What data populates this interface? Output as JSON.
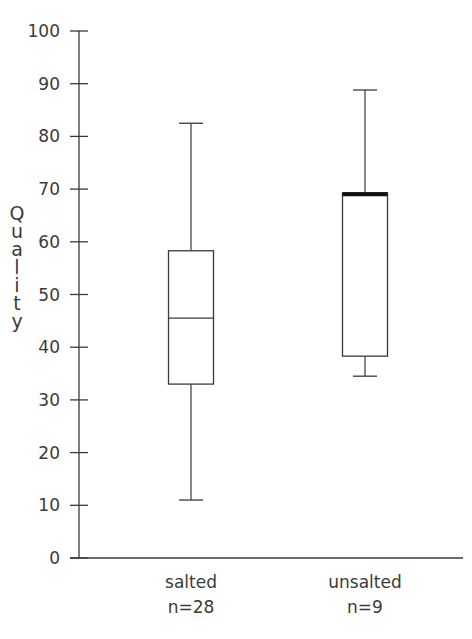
{
  "chart_data": {
    "type": "boxplot",
    "title": "",
    "xlabel": "",
    "ylabel": "Quality",
    "ylim": [
      0,
      100
    ],
    "yticks": [
      0,
      10,
      20,
      30,
      40,
      50,
      60,
      70,
      80,
      90,
      100
    ],
    "grid": false,
    "legend": null,
    "categories": [
      "salted",
      "unsalted"
    ],
    "category_counts": [
      "n=28",
      "n=9"
    ],
    "series": [
      {
        "name": "salted",
        "n": 28,
        "whisker_low": 11,
        "q1": 33,
        "median": 45.5,
        "q3": 58.3,
        "whisker_high": 82.5
      },
      {
        "name": "unsalted",
        "n": 9,
        "whisker_low": 34.5,
        "q1": 38.3,
        "median": 69.3,
        "q3": 69.3,
        "whisker_high": 88.8
      }
    ]
  },
  "axis": {
    "ylabel_chars": [
      "Q",
      "u",
      "a",
      "l",
      "i",
      "t",
      "y"
    ],
    "tick_labels": [
      "0",
      "10",
      "20",
      "30",
      "40",
      "50",
      "60",
      "70",
      "80",
      "90",
      "100"
    ]
  },
  "categories": [
    {
      "label": "salted",
      "count": "n=28"
    },
    {
      "label": "unsalted",
      "count": "n=9"
    }
  ],
  "colors": {
    "line": "#3a3a3a",
    "median_emphasis": "#111111",
    "background": "#ffffff"
  }
}
